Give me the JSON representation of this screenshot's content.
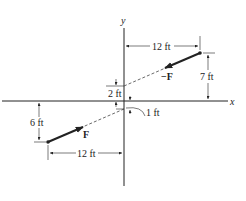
{
  "diagram": {
    "axes": {
      "x_label": "x",
      "y_label": "y"
    },
    "forces": [
      {
        "label": "F",
        "description": "force at lower-left point, directed up-right toward origin line"
      },
      {
        "label": "−F",
        "description": "force at upper-right point, directed down-left"
      }
    ],
    "dimensions": {
      "top_horizontal": "12 ft",
      "right_vertical": "7 ft",
      "upper_offset": "2 ft",
      "lower_offset": "1 ft",
      "left_vertical": "6 ft",
      "bottom_horizontal": "12 ft"
    },
    "colors": {
      "line": "#222222",
      "background": "#ffffff"
    }
  }
}
